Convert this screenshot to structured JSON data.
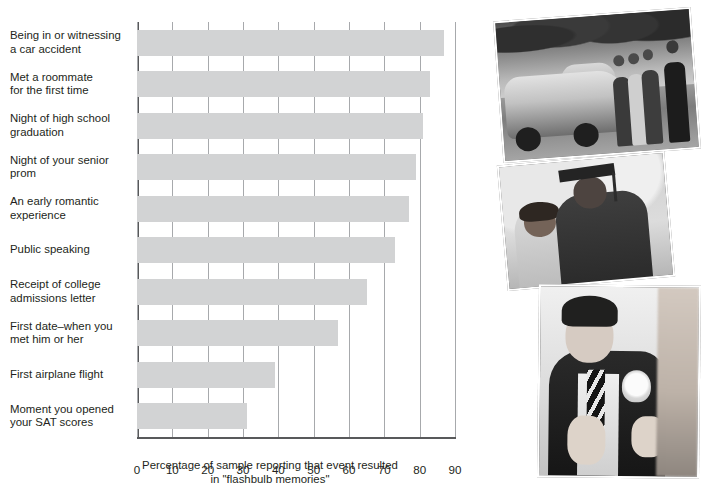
{
  "chart_data": {
    "type": "bar",
    "orientation": "horizontal",
    "title": "",
    "categories": [
      "Being in or witnessing a car accident",
      "Met a roommate for the first time",
      "Night of high school graduation",
      "Night of your senior prom",
      "An early romantic experience",
      "Public speaking",
      "Receipt of college admissions letter",
      "First date–when you met him or her",
      "First airplane flight",
      "Moment you opened your SAT scores"
    ],
    "category_lines": [
      [
        "Being in or witnessing",
        "a car accident"
      ],
      [
        "Met a roommate",
        "for the first time"
      ],
      [
        "Night of high school",
        "graduation"
      ],
      [
        "Night of your senior",
        "prom"
      ],
      [
        "An early romantic",
        "experience"
      ],
      [
        "Public speaking"
      ],
      [
        "Receipt of college",
        "admissions letter"
      ],
      [
        "First date–when you",
        "met him or her"
      ],
      [
        "First airplane flight"
      ],
      [
        "Moment you opened",
        "your SAT scores"
      ]
    ],
    "values": [
      87,
      83,
      81,
      79,
      77,
      73,
      65,
      57,
      39,
      31
    ],
    "xlabel": "Percentage of sample reporting that event resulted in \"flashbulb memories\"",
    "xlabel_lines": [
      "Percentage of sample reporting that event resulted",
      "in \"flashbulb memories\""
    ],
    "ylabel": "",
    "xlim": [
      0,
      90
    ],
    "xticks": [
      0,
      10,
      20,
      30,
      40,
      50,
      60,
      70,
      80,
      90
    ],
    "xtick_labels": [
      "0",
      "10",
      "20",
      "30",
      "40",
      "50",
      "60",
      "70",
      "80",
      "90"
    ],
    "grid": true,
    "grid_axis": "x",
    "legend": false,
    "bar_color": "#d2d3d4",
    "grid_color": "#a7a9ac",
    "axis_color": "#58595b",
    "text_color": "#231f20"
  },
  "photos": [
    {
      "id": "photo-accident",
      "alt": "Black and white photo of a damaged car at the scene of a traffic accident with bystanders and a police officer",
      "semantic": "car-accident-photo"
    },
    {
      "id": "photo-graduation",
      "alt": "Black and white photo of a graduate in cap and gown embracing a woman",
      "semantic": "graduation-photo"
    },
    {
      "id": "photo-prom",
      "alt": "Black and white photo of a young man in a tuxedo having a boutonniere pinned on",
      "semantic": "prom-photo"
    }
  ]
}
